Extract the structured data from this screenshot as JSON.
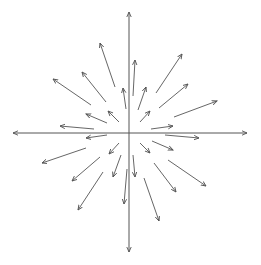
{
  "diagram": {
    "type": "vector-field",
    "colors": {
      "background": "#ffffff",
      "axis": "#555555",
      "arrow": "#555555"
    },
    "axes": {
      "origin": [
        129,
        133
      ],
      "x_axis": {
        "from": [
          13,
          133
        ],
        "to": [
          247,
          133
        ],
        "arrow_both_ends": true
      },
      "y_axis": {
        "from": [
          129,
          252
        ],
        "to": [
          129,
          12
        ],
        "arrow_both_ends": true
      }
    },
    "arrows": [
      {
        "quadrant": "upper-left",
        "from": [
          115,
          87
        ],
        "to": [
          100,
          43
        ]
      },
      {
        "quadrant": "upper-left",
        "from": [
          106,
          102
        ],
        "to": [
          82,
          72
        ]
      },
      {
        "quadrant": "upper-left",
        "from": [
          91,
          105
        ],
        "to": [
          53,
          79
        ]
      },
      {
        "quadrant": "upper-left",
        "from": [
          126,
          109
        ],
        "to": [
          123,
          88
        ]
      },
      {
        "quadrant": "upper-left",
        "from": [
          119,
          122
        ],
        "to": [
          108,
          111
        ]
      },
      {
        "quadrant": "upper-left",
        "from": [
          107,
          123
        ],
        "to": [
          86,
          114
        ]
      },
      {
        "quadrant": "upper-left",
        "from": [
          94,
          129
        ],
        "to": [
          60,
          126
        ]
      },
      {
        "quadrant": "upper-right",
        "from": [
          133,
          96
        ],
        "to": [
          135,
          60
        ]
      },
      {
        "quadrant": "upper-right",
        "from": [
          138,
          110
        ],
        "to": [
          146,
          87
        ]
      },
      {
        "quadrant": "upper-right",
        "from": [
          140,
          122
        ],
        "to": [
          150,
          111
        ]
      },
      {
        "quadrant": "upper-right",
        "from": [
          156,
          93
        ],
        "to": [
          182,
          54
        ]
      },
      {
        "quadrant": "upper-right",
        "from": [
          159,
          108
        ],
        "to": [
          188,
          84
        ]
      },
      {
        "quadrant": "upper-right",
        "from": [
          174,
          117
        ],
        "to": [
          217,
          101
        ]
      },
      {
        "quadrant": "upper-right",
        "from": [
          151,
          129
        ],
        "to": [
          173,
          126
        ]
      },
      {
        "quadrant": "lower-left",
        "from": [
          107,
          135
        ],
        "to": [
          86,
          138
        ]
      },
      {
        "quadrant": "lower-left",
        "from": [
          86,
          148
        ],
        "to": [
          42,
          163
        ]
      },
      {
        "quadrant": "lower-left",
        "from": [
          119,
          143
        ],
        "to": [
          109,
          154
        ]
      },
      {
        "quadrant": "lower-left",
        "from": [
          100,
          157
        ],
        "to": [
          72,
          181
        ]
      },
      {
        "quadrant": "lower-left",
        "from": [
          121,
          155
        ],
        "to": [
          113,
          177
        ]
      },
      {
        "quadrant": "lower-left",
        "from": [
          103,
          172
        ],
        "to": [
          78,
          210
        ]
      },
      {
        "quadrant": "lower-left",
        "from": [
          127,
          169
        ],
        "to": [
          124,
          204
        ]
      },
      {
        "quadrant": "lower-right",
        "from": [
          165,
          135
        ],
        "to": [
          199,
          138
        ]
      },
      {
        "quadrant": "lower-right",
        "from": [
          152,
          141
        ],
        "to": [
          173,
          150
        ]
      },
      {
        "quadrant": "lower-right",
        "from": [
          140,
          143
        ],
        "to": [
          150,
          153
        ]
      },
      {
        "quadrant": "lower-right",
        "from": [
          133,
          155
        ],
        "to": [
          135,
          177
        ]
      },
      {
        "quadrant": "lower-right",
        "from": [
          154,
          163
        ],
        "to": [
          176,
          192
        ]
      },
      {
        "quadrant": "lower-right",
        "from": [
          168,
          160
        ],
        "to": [
          206,
          186
        ]
      },
      {
        "quadrant": "lower-right",
        "from": [
          144,
          178
        ],
        "to": [
          159,
          221
        ]
      }
    ]
  }
}
